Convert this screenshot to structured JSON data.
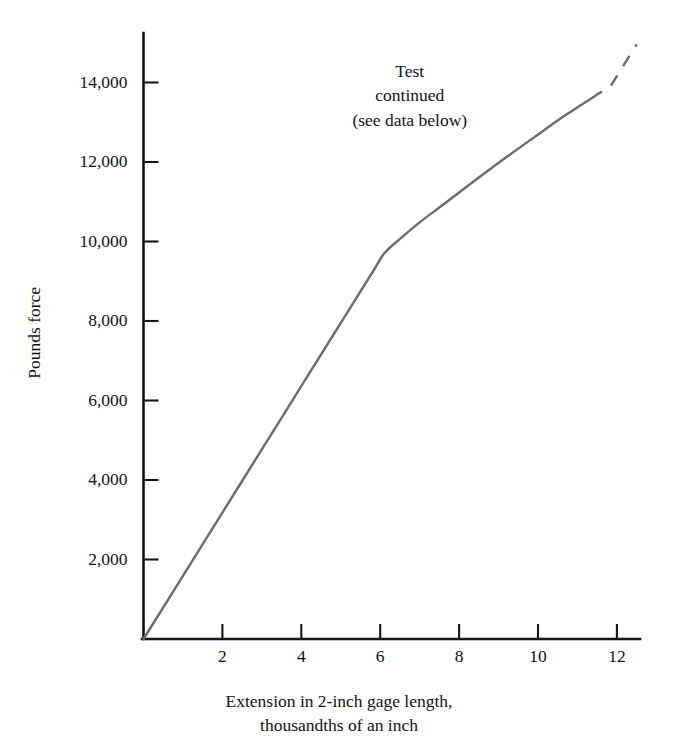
{
  "chart_data": {
    "type": "line",
    "title": "",
    "xlabel": "Extension in 2-inch gage length, thousandths of an inch",
    "ylabel": "Pounds force",
    "xlim": [
      0,
      12.55
    ],
    "ylim": [
      0,
      15100
    ],
    "grid": false,
    "legend": "none",
    "xticks": [
      2,
      4,
      6,
      8,
      10,
      12
    ],
    "xtick_labels": [
      "2",
      "4",
      "6",
      "8",
      "10",
      "12"
    ],
    "yticks": [
      2000,
      4000,
      6000,
      8000,
      10000,
      12000,
      14000
    ],
    "ytick_labels": [
      "2,000",
      "4,000",
      "6,000",
      "8,000",
      "10,000",
      "12,000",
      "14,000"
    ],
    "series": [
      {
        "name": "load-extension",
        "style": "solid",
        "color": "#6b6b6e",
        "x": [
          0,
          1,
          2,
          3,
          4,
          5,
          5.8,
          6.1,
          6.45,
          7,
          7.6,
          8.3,
          9.1,
          9.9,
          10.7,
          11.6
        ],
        "y": [
          0,
          1590,
          3180,
          4770,
          6360,
          7950,
          9220,
          9700,
          10020,
          10480,
          10930,
          11460,
          12050,
          12620,
          13180,
          13760
        ]
      },
      {
        "name": "load-extension-extrapolated",
        "style": "dashed",
        "color": "#6b6b6e",
        "x": [
          11.85,
          12.5
        ],
        "y": [
          13920,
          14960
        ]
      }
    ],
    "annotations": [
      {
        "name": "test-continued-note",
        "lines": [
          "Test",
          "continued",
          "(see data below)"
        ],
        "x": 6.75,
        "y": 14350
      }
    ]
  },
  "xlabel_lines": [
    "Extension in 2-inch gage length,",
    "thousandths of an inch"
  ],
  "annotation_lines": {
    "line1": "Test",
    "line2": "continued",
    "line3": "(see data below)"
  }
}
